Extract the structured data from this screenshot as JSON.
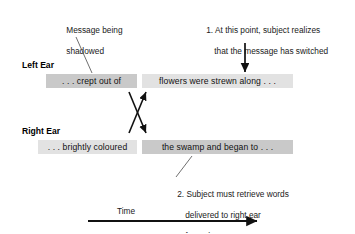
{
  "figure": {
    "title_present": false,
    "background_color": "#ffffff",
    "text_color": "#1a1a1a"
  },
  "annotations": {
    "shadowed_note": {
      "line1": "Message being",
      "line2": "shadowed"
    },
    "note_one": {
      "line1": "1. At this point, subject realizes",
      "line2": "that the message has switched"
    },
    "note_two": {
      "line1": "2. Subject must retrieve words",
      "line2": "delivered to right ear",
      "line3": "from short-term memory"
    }
  },
  "channels": [
    {
      "label": "Left Ear",
      "segments": [
        {
          "text": ". . . crept out of",
          "shade": "dark",
          "shade_color": "#c9c9c9"
        },
        {
          "text": "flowers were strewn along . . .",
          "shade": "light",
          "shade_color": "#e2e2e2"
        }
      ]
    },
    {
      "label": "Right Ear",
      "segments": [
        {
          "text": ". . . brightly coloured",
          "shade": "light",
          "shade_color": "#e2e2e2"
        },
        {
          "text": "the swamp and began to . . .",
          "shade": "dark",
          "shade_color": "#c9c9c9"
        }
      ]
    }
  ],
  "axis": {
    "label": "Time",
    "direction": "left-to-right"
  },
  "connectors": {
    "switch_arrow": "downward-arrow",
    "crossover": "x-crossing-arrows",
    "leader_shadowed": "leader-line",
    "leader_note_two": "leader-line"
  }
}
